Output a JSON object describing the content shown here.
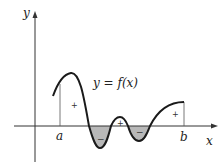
{
  "diagram": {
    "axes": {
      "x_label": "x",
      "y_label": "y"
    },
    "curve_label": "y = f(x)",
    "bounds": {
      "left": "a",
      "right": "b"
    },
    "region_signs": [
      "+",
      "−",
      "+",
      "−",
      "+"
    ],
    "colors": {
      "curve": "#1a1a1a",
      "axis": "#333333",
      "shade": "#b8b8b8"
    }
  }
}
